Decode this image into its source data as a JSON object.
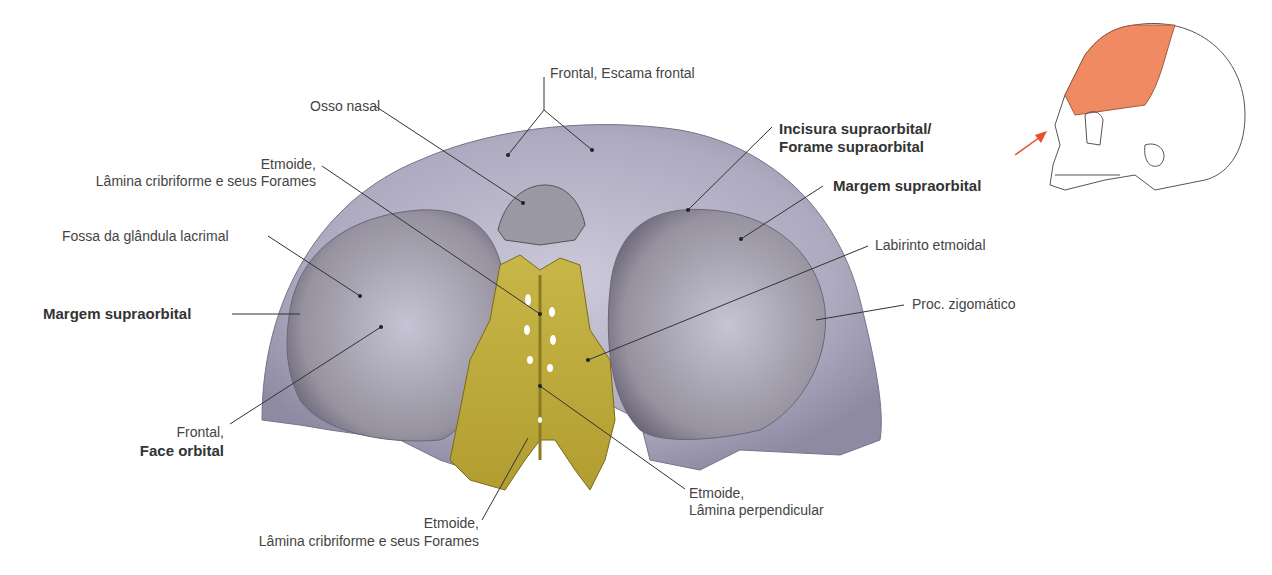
{
  "figure": {
    "colors": {
      "bone": "#b8b4c8",
      "bone_dark": "#7c7890",
      "ethmoid": "#c9b54a",
      "ethmoid_dark": "#8a7a22",
      "highlight": "#f08a62",
      "arrow": "#e8502a"
    },
    "labels": {
      "frontal_escama": "Frontal, Escama frontal",
      "osso_nasal": "Osso nasal",
      "etmoide_top_1": "Etmoide,",
      "etmoide_top_2": "Lâmina cribriforme e seus Forames",
      "fossa_lacrimal": "Fossa da glândula lacrimal",
      "margem_left": "Margem supraorbital",
      "frontal_face_1": "Frontal,",
      "frontal_face_2": "Face orbital",
      "incisura_1": "Incisura supraorbital/",
      "incisura_2": "Forame supraorbital",
      "margem_right": "Margem supraorbital",
      "labirinto": "Labirinto etmoidal",
      "proc_zigomatico": "Proc. zigomático",
      "etmoide_perp_1": "Etmoide,",
      "etmoide_perp_2": "Lâmina perpendicular",
      "etmoide_bottom_1": "Etmoide,",
      "etmoide_bottom_2": "Lâmina cribriforme e seus Forames"
    }
  }
}
